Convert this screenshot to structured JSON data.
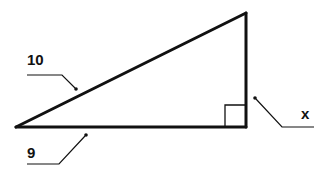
{
  "diagram": {
    "type": "right-triangle",
    "colors": {
      "stroke": "#111111",
      "background": "#ffffff"
    },
    "labels": {
      "hypotenuse": "10",
      "base": "9",
      "height": "x"
    },
    "right_angle_marker": true
  }
}
